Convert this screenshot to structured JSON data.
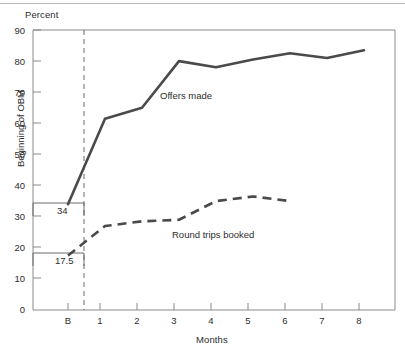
{
  "chart_data": {
    "type": "line",
    "title": "",
    "subtitle": "",
    "xlabel": "Months",
    "ylabel": "Percent",
    "ylim": [
      0,
      90
    ],
    "yticks": [
      0,
      10,
      20,
      30,
      40,
      50,
      60,
      70,
      80,
      90
    ],
    "ytick_labels": [
      "0",
      "10",
      "20",
      "30",
      "40",
      "50",
      "60",
      "70",
      "80",
      "90"
    ],
    "x": [
      "B",
      "1",
      "2",
      "3",
      "4",
      "5",
      "6",
      "7",
      "8"
    ],
    "xtick_labels": [
      "B",
      "1",
      "2",
      "3",
      "4",
      "5",
      "6",
      "7",
      "8"
    ],
    "grid": false,
    "legend_position": "inline-annotation",
    "series": [
      {
        "name": "Offers made",
        "style": "solid",
        "color": "#4a4a4a",
        "x": [
          "B",
          "1",
          "2",
          "3",
          "4",
          "5",
          "6",
          "7",
          "8"
        ],
        "values": [
          34,
          61.5,
          65,
          80,
          78,
          80.5,
          82.5,
          81,
          83.5
        ]
      },
      {
        "name": "Round trips booked",
        "style": "dashed",
        "color": "#4a4a4a",
        "x": [
          "B",
          "1",
          "2",
          "3",
          "4",
          "5",
          "6"
        ],
        "values": [
          17.5,
          27,
          28.5,
          29,
          35,
          36.5,
          35
        ]
      }
    ],
    "annotations": [
      {
        "text": "Beginning of OBM",
        "kind": "vertical-divider-label"
      },
      {
        "text": "Offers made",
        "kind": "series-label"
      },
      {
        "text": "Round trips booked",
        "kind": "series-label"
      },
      {
        "text": "34",
        "kind": "baseline-value",
        "value": 34
      },
      {
        "text": "17.5",
        "kind": "baseline-value",
        "value": 17.5
      }
    ],
    "reference_lines": [
      {
        "orientation": "vertical",
        "label": "Beginning of OBM",
        "style": "dashed",
        "at": "between B and 1"
      },
      {
        "orientation": "horizontal",
        "label": "34",
        "value": 34,
        "style": "solid",
        "extent": "axis to divider"
      },
      {
        "orientation": "horizontal",
        "label": "17.5",
        "value": 17.5,
        "style": "solid",
        "extent": "axis to divider"
      }
    ]
  },
  "axes": {
    "ylabel": "Percent",
    "xlabel": "Months",
    "ytick_labels": [
      "90",
      "80",
      "70",
      "60",
      "50",
      "40",
      "30",
      "20",
      "10",
      "0"
    ],
    "xtick_labels": [
      "B",
      "1",
      "2",
      "3",
      "4",
      "5",
      "6",
      "7",
      "8"
    ]
  },
  "labels": {
    "offers_made": "Offers made",
    "round_trips_booked": "Round trips booked",
    "beginning_of_obm": "Beginning of OBM",
    "baseline_offers": "34",
    "baseline_round_trips": "17.5"
  },
  "colors": {
    "line": "#4a4a4a",
    "axis": "#808080",
    "text": "#2d2d2d",
    "background": "#ffffff"
  }
}
